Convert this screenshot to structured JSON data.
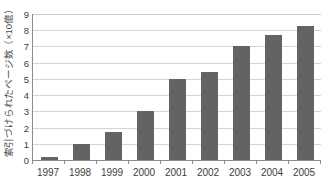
{
  "chart_data": {
    "type": "bar",
    "title": "",
    "xlabel": "",
    "ylabel": "索引づけられたページ数（×10億）",
    "categories": [
      "1997",
      "1998",
      "1999",
      "2000",
      "2001",
      "2002",
      "2003",
      "2004",
      "2005"
    ],
    "values": [
      0.2,
      1.0,
      1.75,
      3.0,
      5.0,
      5.45,
      7.0,
      7.7,
      8.25
    ],
    "ylim": [
      0,
      9
    ],
    "ytick_labels": [
      "0",
      "1",
      "2",
      "3",
      "4",
      "5",
      "6",
      "7",
      "8",
      "9"
    ],
    "ytick_values": [
      0,
      1,
      2,
      3,
      4,
      5,
      6,
      7,
      8,
      9
    ],
    "grid": true,
    "legend": false,
    "legend_position": "none",
    "series": [
      {
        "name": "索引づけられたページ数",
        "color": "#636363",
        "values": [
          0.2,
          1.0,
          1.75,
          3.0,
          5.0,
          5.45,
          7.0,
          7.7,
          8.25
        ]
      }
    ],
    "colors": {
      "bar": "#636363",
      "gridline": "#d6d6d6",
      "axis": "#8c8c8c",
      "text": "#3d3d3d",
      "background": "#ffffff"
    }
  }
}
